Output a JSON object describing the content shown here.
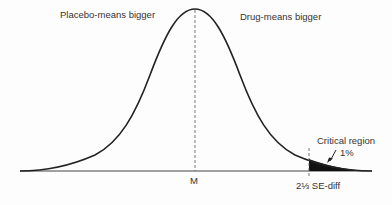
{
  "diagram": {
    "type": "normal-distribution-curve",
    "labels": {
      "left_region": "Placebo-means bigger",
      "right_region": "Drug-means bigger",
      "mean": "M",
      "critical_x": "2⅓ SE-diff",
      "critical_region": "Critical region",
      "critical_pct": "1%"
    },
    "colors": {
      "curve": "#222222",
      "axis": "#444444",
      "shaded": "#111111",
      "text": "#333333"
    }
  }
}
